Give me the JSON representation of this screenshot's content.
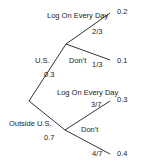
{
  "branches": {
    "us": {
      "label": "U.S.",
      "prob": "0.3"
    },
    "outside": {
      "label": "Outside U.S.",
      "prob": "0.7"
    }
  },
  "us_children": {
    "log": {
      "label": "Log On Every Day",
      "prob": "2/3",
      "result": "0.2"
    },
    "dont": {
      "label": "Don't",
      "prob": "1/3",
      "result": "0.1"
    }
  },
  "outside_children": {
    "log": {
      "label": "Log On Every Day",
      "prob": "3/7",
      "result": "0.3"
    },
    "dont": {
      "label": "Don't",
      "prob": "4/7",
      "result": "0.4"
    }
  }
}
